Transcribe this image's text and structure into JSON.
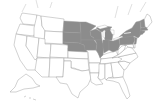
{
  "map": {
    "region": "United States",
    "highlight_color": "#8c8c8c",
    "base_color": "#ffffff",
    "border_color": "#9a9a9a",
    "highlighted_states": [
      "North Dakota",
      "South Dakota",
      "Nebraska",
      "Minnesota",
      "Iowa",
      "Wisconsin",
      "Illinois",
      "Michigan",
      "Indiana",
      "Ohio",
      "Pennsylvania",
      "New York",
      "Vermont",
      "New Hampshire",
      "Massachusetts",
      "Connecticut",
      "Rhode Island",
      "New Jersey"
    ],
    "insets": [
      "Alaska",
      "Hawaii"
    ]
  }
}
